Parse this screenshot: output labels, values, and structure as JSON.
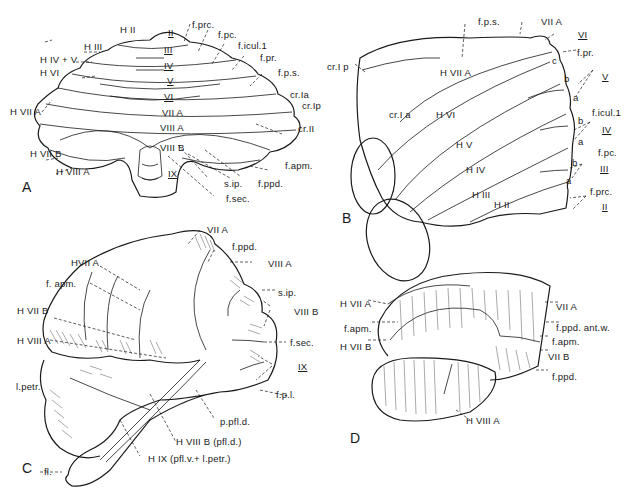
{
  "figure": {
    "panels": [
      {
        "id": "A",
        "view": "dorsal"
      },
      {
        "id": "B",
        "view": "lateral-anterior"
      },
      {
        "id": "C",
        "view": "posterolateral"
      },
      {
        "id": "D",
        "view": "lateral"
      }
    ]
  },
  "panel_A": {
    "letter": "A",
    "labels": {
      "HII": "H II",
      "HIII": "H III",
      "HIVV": "H IV + V",
      "HVI": "H VI",
      "HVIIA": "H VII A",
      "HVIIB": "H VII B",
      "HVIIIA": "H VIII A",
      "II": "II",
      "III": "III",
      "IV": "IV",
      "V": "V",
      "VI": "VI",
      "VIIA": "VII A",
      "VIIIA": "VIII A",
      "VIIIB": "VIII B",
      "IX": "IX",
      "fprc": "f.prc.",
      "fpc": "f.pc.",
      "ficul": "f.icul.1",
      "fpr": "f.pr.",
      "fps": "f.p.s.",
      "crIa": "cr.Ia",
      "crIp": "cr.Ip",
      "crII": "cr.II",
      "fapm": "f.apm.",
      "fppd": "f.ppd.",
      "sip": "s.ip.",
      "fsec": "f.sec."
    }
  },
  "panel_B": {
    "letter": "B",
    "labels": {
      "fps": "f.p.s.",
      "VIIA": "VII A",
      "VI": "VI",
      "fpr": "f.pr.",
      "c": "c",
      "b1": "b",
      "a1": "a",
      "V": "V",
      "ficul": "f.icul.1",
      "b2": "b",
      "IV": "IV",
      "a2": "a",
      "fpc": "f.pc.",
      "b3": "b",
      "III": "III",
      "a3": "a",
      "fprc": "f.prc.",
      "II": "II",
      "crIp": "cr.I p",
      "HVIIA": "H VII A",
      "crIa": "cr.I a",
      "HVI": "H VI",
      "HV": "H V",
      "HIV": "H IV",
      "HIII": "H III",
      "HII": "H II"
    }
  },
  "panel_C": {
    "letter": "C",
    "labels": {
      "VIIA": "VII A",
      "fppd": "f.ppd.",
      "HVIIA": "HVII A",
      "VIIIA": "VIII A",
      "fapm": "f. apm.",
      "sip": "s.ip.",
      "HVIIB": "H VII B",
      "VIIIB": "VIII B",
      "HVIIIA": "H VIII A",
      "fsec": "f.sec.",
      "IX": "IX",
      "lpetr": "l.petr.",
      "fpl": "f.p.l.",
      "ppfld": "p.pfl.d.",
      "HVIIIB": "H VIII B (pfl.d.)",
      "HIX": "H IX (pfl.v.+ l.petr.)",
      "fl": "fl."
    }
  },
  "panel_D": {
    "letter": "D",
    "labels": {
      "HVIIA": "H VII A",
      "fapm_l": "f.apm.",
      "HVIIB": "H VII B",
      "VIIA": "VII A",
      "fppd_ant": "f.ppd. ant.w.",
      "fapm_r": "f.apm.",
      "VIIB": "VII B",
      "fppd": "f.ppd.",
      "HVIIIA": "H VIII A"
    }
  }
}
